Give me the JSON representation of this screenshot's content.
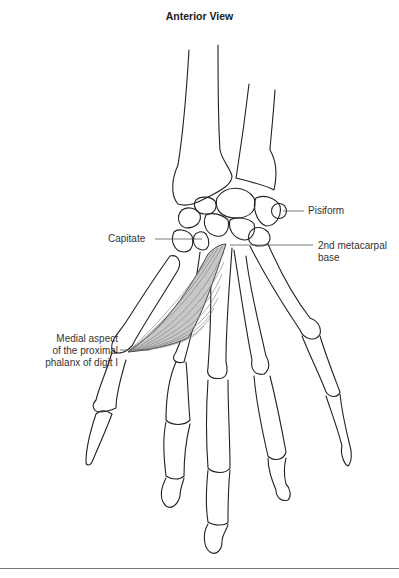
{
  "figure": {
    "title": "Anterior View",
    "colors": {
      "bone_outline": "#222222",
      "muscle_fill": "#c8c8c8",
      "muscle_fibers": "#7a7a7a",
      "leader_line": "#555555",
      "bottom_rule": "#777777"
    },
    "labels": {
      "pisiform": "Pisiform",
      "capitate": "Capitate",
      "metacarpal_line1": "2nd metacarpal",
      "metacarpal_line2": "base",
      "medial_line1": "Medial aspect",
      "medial_line2": "of the proximal",
      "medial_line3": "phalanx of digit I"
    }
  }
}
